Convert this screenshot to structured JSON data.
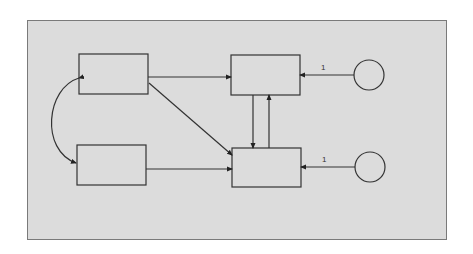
{
  "diagram": {
    "type": "path-diagram",
    "background": "#dcdcdc",
    "stroke": "#333333",
    "nodes": [
      {
        "id": "box-top-left",
        "shape": "rectangle",
        "label": ""
      },
      {
        "id": "box-bottom-left",
        "shape": "rectangle",
        "label": ""
      },
      {
        "id": "box-top-right",
        "shape": "rectangle",
        "label": ""
      },
      {
        "id": "box-bottom-right",
        "shape": "rectangle",
        "label": ""
      },
      {
        "id": "error-top",
        "shape": "circle",
        "label": ""
      },
      {
        "id": "error-bottom",
        "shape": "circle",
        "label": ""
      }
    ],
    "edges": [
      {
        "from": "box-top-left",
        "to": "box-bottom-left",
        "kind": "curved-double-arrow",
        "label": ""
      },
      {
        "from": "box-top-left",
        "to": "box-top-right",
        "kind": "arrow",
        "label": ""
      },
      {
        "from": "box-top-left",
        "to": "box-bottom-right",
        "kind": "arrow",
        "label": ""
      },
      {
        "from": "box-bottom-left",
        "to": "box-bottom-right",
        "kind": "arrow",
        "label": ""
      },
      {
        "from": "box-top-right",
        "to": "box-bottom-right",
        "kind": "arrow",
        "label": ""
      },
      {
        "from": "box-bottom-right",
        "to": "box-top-right",
        "kind": "arrow",
        "label": ""
      },
      {
        "from": "error-top",
        "to": "box-top-right",
        "kind": "arrow",
        "label": "1"
      },
      {
        "from": "error-bottom",
        "to": "box-bottom-right",
        "kind": "arrow",
        "label": "1"
      }
    ],
    "edge_labels": {
      "error_top": "1",
      "error_bottom": "1"
    }
  }
}
